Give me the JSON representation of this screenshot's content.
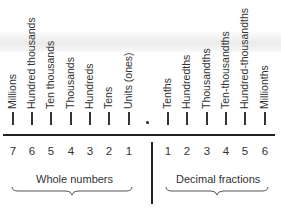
{
  "diagram": {
    "whole_places": [
      {
        "label": "Millions",
        "digit": "7",
        "x": 13
      },
      {
        "label": "Hundred thousands",
        "digit": "6",
        "x": 32
      },
      {
        "label": "Ten thousands",
        "digit": "5",
        "x": 51
      },
      {
        "label": "Thousands",
        "digit": "4",
        "x": 71
      },
      {
        "label": "Hundreds",
        "digit": "3",
        "x": 90
      },
      {
        "label": "Tens",
        "digit": "2",
        "x": 109
      },
      {
        "label": "Units (ones)",
        "digit": "1",
        "x": 129
      }
    ],
    "decimal_point": "•",
    "decimal_places": [
      {
        "label": "Tenths",
        "digit": "1",
        "x": 168
      },
      {
        "label": "Hundredths",
        "digit": "2",
        "x": 187
      },
      {
        "label": "Thousandths",
        "digit": "3",
        "x": 207
      },
      {
        "label": "Ten-thousandths",
        "digit": "4",
        "x": 226
      },
      {
        "label": "Hundred-thousandths",
        "digit": "5",
        "x": 245
      },
      {
        "label": "Millionths",
        "digit": "6",
        "x": 265
      }
    ],
    "groups": {
      "whole": "Whole numbers",
      "decimal": "Decimal fractions"
    }
  }
}
